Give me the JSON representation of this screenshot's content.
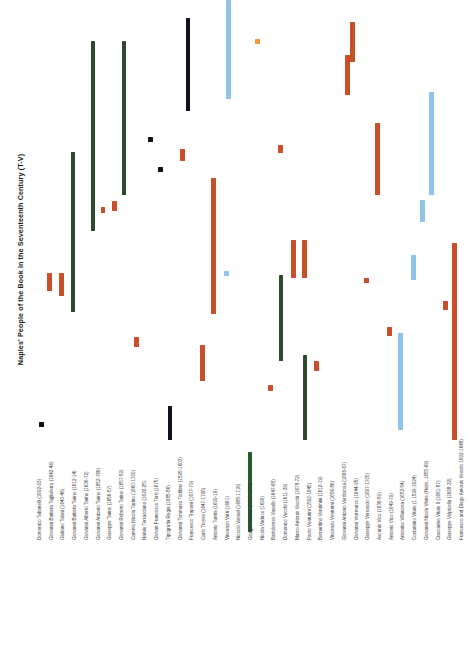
{
  "chart_data": {
    "type": "bar",
    "orientation": "vertical-gantt",
    "title": "Naples' People of the Book in the Seventeenth Century (T-V)",
    "xlabel": "",
    "ylabel": "",
    "grid": false,
    "legend": "none",
    "ylim": [
      1600,
      1700
    ],
    "colors": {
      "dark_green": "#2d4a2a",
      "orange_red": "#c7502a",
      "light_blue": "#8fc4e8",
      "dark_navy": "#0f1023",
      "black": "#111111",
      "light_orange": "#f09a3e",
      "background": "#ffffff"
    },
    "categories": [
      "Domenico Tabanelli (1692-93)",
      "Giovanni Battista Tagliaferro (1642-46)",
      "Giuliano Talani (1640-46)",
      "Giovanni Battista Tarino (1612-14)",
      "Giovanni Alberto Tarino (1636-72)",
      "Giovanni Antonio Tarino (1652-766)",
      "Giuseppe Tarino (1656-57)",
      "Giovanni Roberto Tarino (1657-59)",
      "Cammo Nicola Tarino (1660-1700)",
      "Natale Terracciano (1622-25)",
      "Giovan Francesco Terri (1675)",
      "Tipografia Regia (1685-86)",
      "Giovanni Tommaso Toddino (1595-1603)",
      "Francesco Trapani (1677-79)",
      "Carlo Troyse (1647-1706)",
      "Antonio Turrini (1609-19)",
      "Vincenzo Vatri (1661)",
      "Niccolo Valvuri (1685-1716)",
      "Giorgio Varnuzi (1597-1686)",
      "Nicola Vaduco (1699)",
      "Bartolomeo Vasallo (1647-68)",
      "Domenico Vecchi (1611-39)",
      "Marco Antonio Vecchi (1678-72)",
      "Paolo Venturini (1592-1645)",
      "Bernardino Ventimini (1612-19)",
      "Vincenzo Venturini (1656-86)",
      "Giovanni Antonio Verdorosa (1666-67)",
      "Giovanni Verrmarco (1644-95)",
      "Giuseppe Versaccio (1697-1705)",
      "Ascanio Vico (1636-59)",
      "Antonio Vico (1649-79)",
      "Antonino Villanova (1652-54)",
      "Costantino Vitale (1 1599-1624)",
      "Giovanni Nicola Vitale (Heirs, 1655-69)",
      "Ciaccarino Vitale II (1661-87)",
      "Giuseppe Volpicella (1698-32)",
      "Francesco and Diego Antonio Vessilo 1692-1648)"
    ],
    "bars": [
      {
        "index": 0,
        "label": "Domenico Tabanelli (1692-93)",
        "start": 1692,
        "end": 1693,
        "color": "#111111",
        "x": 39,
        "y": 422,
        "h": 5,
        "w": 4.5
      },
      {
        "index": 1,
        "label": "Giovanni Battista Tagliaferro (1642-46)",
        "start": 1642,
        "end": 1646,
        "color": "#c7502a",
        "x": 47,
        "y": 273,
        "h": 18,
        "w": 4.5
      },
      {
        "index": 2,
        "label": "Giuliano Talani (1640-46)",
        "start": 1640,
        "end": 1646,
        "color": "#c7502a",
        "x": 59,
        "y": 273,
        "h": 23,
        "w": 4.5
      },
      {
        "index": 3,
        "label": "Giovanni Battista Tarino (1612-14)",
        "start": 1612,
        "end": 1614,
        "color": "#2d4a2a",
        "x": 71,
        "y": 152,
        "h": 160,
        "w": 3.5
      },
      {
        "index": 4,
        "label": "Giovanni Alberto Tarino (1636-72)",
        "start": 1636,
        "end": 1672,
        "color": "#2d4a2a",
        "x": 91,
        "y": 41,
        "h": 190,
        "w": 3.5
      },
      {
        "index": 5,
        "label": "Giovanni Antonio Tarino (1652-766)",
        "start": 1652,
        "end": 1676,
        "color": "#c7502a",
        "x": 101,
        "y": 207,
        "h": 6,
        "w": 4.0
      },
      {
        "index": 6,
        "label": "Giuseppe Tarino (1656-57)",
        "start": 1656,
        "end": 1657,
        "color": "#c7502a",
        "x": 112,
        "y": 201,
        "h": 10,
        "w": 4.5
      },
      {
        "index": 7,
        "label": "Giovanni Roberto Tarino (1657-59)",
        "start": 1657,
        "end": 1659,
        "color": "#2d4a2a",
        "x": 122,
        "y": 41,
        "h": 154,
        "w": 3.5
      },
      {
        "index": 8,
        "label": "Cammo Nicola Tarino (1660-1700)",
        "start": 1660,
        "end": 1700,
        "color": "#c7502a",
        "x": 134,
        "y": 337,
        "h": 10,
        "w": 4.5
      },
      {
        "index": 9,
        "label": "Natale Terracciano (1622-25)",
        "start": 1622,
        "end": 1625,
        "color": "#111111",
        "x": 148,
        "y": 137,
        "h": 5,
        "w": 4.5
      },
      {
        "index": 10,
        "label": "Giovan Francesco Terri (1675)",
        "start": 1675,
        "end": 1675,
        "color": "#111111",
        "x": 158,
        "y": 167,
        "h": 5,
        "w": 4.5
      },
      {
        "index": 11,
        "label": "Tipografia Regia (1685-86)",
        "start": 1685,
        "end": 1686,
        "color": "#0f1023",
        "x": 186,
        "y": 18,
        "h": 93,
        "w": 4.0
      },
      {
        "index": 12,
        "label": "Giovanni Tommaso Toddino (1595-1603)",
        "start": 1595,
        "end": 1603,
        "color": "#c7502a",
        "x": 180,
        "y": 149,
        "h": 12,
        "w": 4.5
      },
      {
        "index": 13,
        "label": "Francesco Trapani (1677-79)",
        "start": 1677,
        "end": 1679,
        "color": "#c7502a",
        "x": 211,
        "y": 178,
        "h": 136,
        "w": 4.5
      },
      {
        "index": 14,
        "label": "Carlo Troyse (1647-1706)",
        "start": 1647,
        "end": 1706,
        "color": "#8fc4e8",
        "x": 226,
        "y": 0,
        "h": 99,
        "w": 4.5
      },
      {
        "index": 15,
        "label": "Antonio Turrini (1609-19)",
        "start": 1609,
        "end": 1619,
        "color": "#8fc4e8",
        "x": 224,
        "y": 271,
        "h": 5,
        "w": 4.5
      },
      {
        "index": 16,
        "label": "Vincenzo Vatri (1661)",
        "start": 1661,
        "end": 1661,
        "color": "#c7502a",
        "x": 200,
        "y": 345,
        "h": 36,
        "w": 4.5
      },
      {
        "index": 17,
        "label": "Niccolo Valvuri (1685-1716)",
        "start": 1685,
        "end": 1716,
        "color": "#0f1023",
        "x": 168,
        "y": 406,
        "h": 34,
        "w": 4.0
      },
      {
        "index": 18,
        "label": "Giorgio Varnuzi (1597-1686)",
        "start": 1597,
        "end": 1686,
        "color": "#255c2a",
        "x": 248,
        "y": 452,
        "h": 80,
        "w": 4.0
      },
      {
        "index": 19,
        "label": "Nicola Vaduco (1699)",
        "start": 1699,
        "end": 1699,
        "color": "#f09a3e",
        "x": 255,
        "y": 39,
        "h": 5,
        "w": 5.0
      },
      {
        "index": 20,
        "label": "Bartolomeo Vasallo (1647-68)",
        "start": 1647,
        "end": 1668,
        "color": "#c7502a",
        "x": 278,
        "y": 145,
        "h": 8,
        "w": 5.0
      },
      {
        "index": 21,
        "label": "Domenico Vecchi (1611-39)",
        "start": 1611,
        "end": 1639,
        "color": "#c7502a",
        "x": 291,
        "y": 240,
        "h": 38,
        "w": 4.5
      },
      {
        "index": 22,
        "label": "Marco Antonio Vecchi (1678-72)",
        "start": 1672,
        "end": 1678,
        "color": "#c7502a",
        "x": 302,
        "y": 240,
        "h": 38,
        "w": 4.5
      },
      {
        "index": 23,
        "label": "Paolo Venturini (1592-1645)",
        "start": 1592,
        "end": 1645,
        "color": "#2d4a2a",
        "x": 279,
        "y": 275,
        "h": 86,
        "w": 4.0
      },
      {
        "index": 24,
        "label": "Bernardino Ventimini (1612-19)",
        "start": 1612,
        "end": 1619,
        "color": "#2d4a2a",
        "x": 303,
        "y": 355,
        "h": 85,
        "w": 4.0
      },
      {
        "index": 25,
        "label": "Vincenzo Venturini (1656-86)",
        "start": 1656,
        "end": 1686,
        "color": "#c7502a",
        "x": 314,
        "y": 361,
        "h": 10,
        "w": 4.5
      },
      {
        "index": 26,
        "label": "Giovanni Antonio Verdorosa (1666-67)",
        "start": 1666,
        "end": 1667,
        "color": "#c7502a",
        "x": 268,
        "y": 385,
        "h": 6,
        "w": 4.5
      },
      {
        "index": 27,
        "label": "Giovanni Verrmarco (1644-95)",
        "start": 1644,
        "end": 1695,
        "color": "#c7502a",
        "x": 345,
        "y": 55,
        "h": 40,
        "w": 4.5
      },
      {
        "index": 28,
        "label": "Giuseppe Versaccio (1697-1705)",
        "start": 1697,
        "end": 1705,
        "color": "#c7502a",
        "x": 350,
        "y": 22,
        "h": 40,
        "w": 4.5
      },
      {
        "index": 29,
        "label": "Ascanio Vico (1636-59)",
        "start": 1636,
        "end": 1659,
        "color": "#c7502a",
        "x": 375,
        "y": 123,
        "h": 72,
        "w": 4.5
      },
      {
        "index": 30,
        "label": "Antonio Vico (1649-79)",
        "start": 1649,
        "end": 1679,
        "color": "#8fc4e8",
        "x": 429,
        "y": 92,
        "h": 103,
        "w": 4.5
      },
      {
        "index": 31,
        "label": "Antonino Villanova (1652-54)",
        "start": 1652,
        "end": 1654,
        "color": "#8fc4e8",
        "x": 420,
        "y": 200,
        "h": 22,
        "w": 4.5
      },
      {
        "index": 32,
        "label": "Costantino Vitale (1 1599-1624)",
        "start": 1599,
        "end": 1624,
        "color": "#8fc4e8",
        "x": 411,
        "y": 255,
        "h": 25,
        "w": 4.5
      },
      {
        "index": 33,
        "label": "Giovanni Nicola Vitale (Heirs, 1655-69)",
        "start": 1655,
        "end": 1669,
        "color": "#c7502a",
        "x": 364,
        "y": 278,
        "h": 5,
        "w": 4.5
      },
      {
        "index": 34,
        "label": "Ciaccarino Vitale II (1661-87)",
        "start": 1661,
        "end": 1687,
        "color": "#c7502a",
        "x": 443,
        "y": 301,
        "h": 9,
        "w": 4.5
      },
      {
        "index": 35,
        "label": "Giuseppe Volpicella (1698-32)",
        "start": 1698,
        "end": 1732,
        "color": "#c7502a",
        "x": 387,
        "y": 327,
        "h": 9,
        "w": 4.5
      },
      {
        "index": 36,
        "label": "Francesco and Diego Antonio Vessilo 1692-1648)",
        "start": 1692,
        "end": 1748,
        "color": "#8fc4e8",
        "x": 398,
        "y": 333,
        "h": 97,
        "w": 4.5
      },
      {
        "index": 37,
        "label": "Francesco and Diego Antonio Vessilo (tail)",
        "start": 1692,
        "end": 1748,
        "color": "#c7502a",
        "x": 452,
        "y": 243,
        "h": 197,
        "w": 4.5
      }
    ]
  }
}
